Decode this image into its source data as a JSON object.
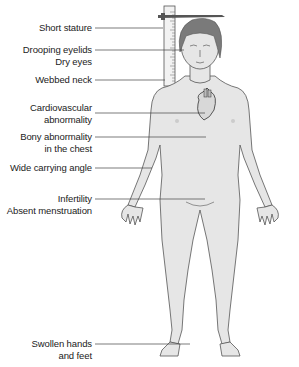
{
  "figure": {
    "colors": {
      "skin": "#e6e6e6",
      "outline": "#555555",
      "hair": "#7a7a7a",
      "leader_line": "#444444",
      "text": "#222222"
    },
    "labels": [
      {
        "id": "short-stature",
        "lines": [
          "Short stature"
        ],
        "top": 22,
        "line_y": 28,
        "line_x2": 163
      },
      {
        "id": "drooping-eyelids",
        "lines": [
          "Drooping eyelids",
          "Dry eyes"
        ],
        "top": 44,
        "line_y": 50,
        "line_x2": 184
      },
      {
        "id": "webbed-neck",
        "lines": [
          "Webbed neck"
        ],
        "top": 74,
        "line_y": 80,
        "line_x2": 165
      },
      {
        "id": "cardiovascular",
        "lines": [
          "Cardiovascular",
          "abnormality"
        ],
        "top": 102,
        "line_y": 113,
        "line_x2": 205
      },
      {
        "id": "bony-chest",
        "lines": [
          "Bony abnormality",
          "in the chest"
        ],
        "top": 131,
        "line_y": 137,
        "line_x2": 206
      },
      {
        "id": "carrying-angle",
        "lines": [
          "Wide carrying angle"
        ],
        "top": 162,
        "line_y": 168,
        "line_x2": 152
      },
      {
        "id": "infertility",
        "lines": [
          "Infertility",
          "Absent menstruation"
        ],
        "top": 193,
        "line_y": 199,
        "line_x2": 205
      },
      {
        "id": "swollen-hands-feet",
        "lines": [
          "Swollen hands",
          "and feet"
        ],
        "top": 338,
        "line_y": 344,
        "line_x2": 190
      }
    ]
  }
}
